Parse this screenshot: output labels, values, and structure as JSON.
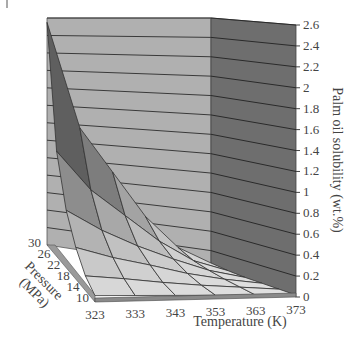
{
  "chart_data": {
    "type": "surface3d",
    "title": "",
    "xlabel": "Temperature (K)",
    "ylabel": "Pressure (MPa)",
    "zlabel": "Palm oil solubility (wt.%)",
    "x_ticks": [
      "323",
      "333",
      "343",
      "353",
      "363",
      "373"
    ],
    "y_ticks": [
      "10",
      "14",
      "18",
      "22",
      "26",
      "30"
    ],
    "z_ticks": [
      "0",
      "0.2",
      "0.4",
      "0.6",
      "0.8",
      "1",
      "1.2",
      "1.4",
      "1.6",
      "1.8",
      "2",
      "2.2",
      "2.4",
      "2.6"
    ],
    "xlim": [
      323,
      373
    ],
    "ylim": [
      10,
      30
    ],
    "zlim": [
      0,
      2.6
    ],
    "grid": true,
    "legend": null,
    "surface_values_are_estimates": true,
    "surface_note": "Approximate values estimated by eye from the 3D projection; not printed on the figure and not measured data.",
    "surface_estimate": {
      "x": [
        323,
        333,
        343,
        353,
        363,
        373
      ],
      "y": [
        10,
        14,
        18,
        22,
        26,
        30
      ],
      "z": [
        [
          0.05,
          0.04,
          0.03,
          0.02,
          0.01,
          0.0
        ],
        [
          0.15,
          0.12,
          0.08,
          0.05,
          0.03,
          0.01
        ],
        [
          0.35,
          0.25,
          0.18,
          0.1,
          0.05,
          0.02
        ],
        [
          0.65,
          0.45,
          0.3,
          0.18,
          0.08,
          0.03
        ],
        [
          1.2,
          0.8,
          0.55,
          0.3,
          0.12,
          0.05
        ],
        [
          2.55,
          1.4,
          0.95,
          0.5,
          0.2,
          0.08
        ]
      ]
    }
  }
}
